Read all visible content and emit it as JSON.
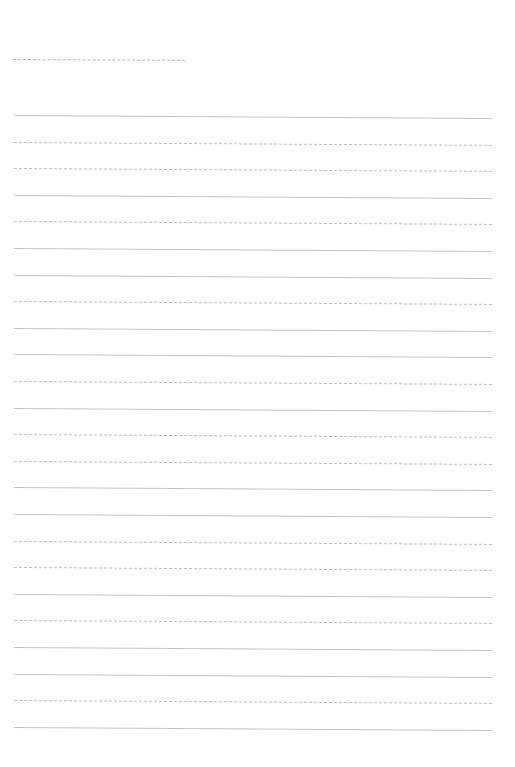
{
  "page": {
    "type": "lined-paper",
    "background": "#ffffff",
    "line_color": "#c4c4c4"
  },
  "header": {
    "name_line": {
      "x": 13,
      "y": 59,
      "width": 172
    }
  },
  "ruled_lines": {
    "count": 24,
    "start_y": 115,
    "spacing": 26.6,
    "left": 14,
    "width": 478
  }
}
